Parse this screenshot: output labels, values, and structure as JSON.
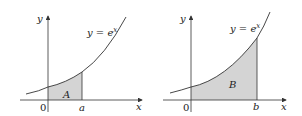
{
  "figure": {
    "panels": [
      {
        "id": "left",
        "curve_label": "y = e",
        "curve_exponent": "x",
        "region_label": "A",
        "origin_label": "0",
        "bound_label": "a",
        "x_axis_label": "x",
        "y_axis_label": "y"
      },
      {
        "id": "right",
        "curve_label": "y = e",
        "curve_exponent": "x",
        "region_label": "B",
        "origin_label": "0",
        "bound_label": "b",
        "x_axis_label": "x",
        "y_axis_label": "y"
      }
    ],
    "colors": {
      "shade": "#d4d4d4",
      "axis": "#333333",
      "curve": "#333333"
    }
  }
}
